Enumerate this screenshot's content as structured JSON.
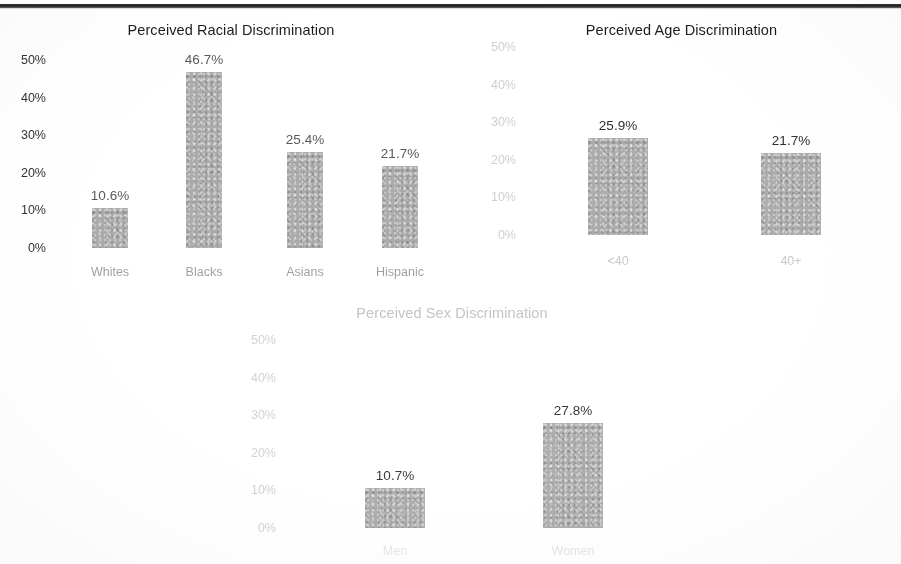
{
  "figure": {
    "page_rule": "horizontal-rule",
    "bar_color": "#a8a8a8",
    "background_color": "#ffffff"
  },
  "chart_data": [
    {
      "id": "racial",
      "type": "bar",
      "title": "Perceived Racial Discrimination",
      "xlabel": "",
      "ylabel": "",
      "categories": [
        "Whites",
        "Blacks",
        "Asians",
        "Hispanic"
      ],
      "values": [
        10.6,
        46.7,
        25.4,
        21.7
      ],
      "data_labels": [
        "10.6%",
        "46.7%",
        "25.4%",
        "21.7%"
      ],
      "ylim": [
        0,
        50
      ],
      "yticks": [
        50,
        40,
        30,
        20,
        10,
        0
      ],
      "ytick_labels": [
        "50%",
        "40%",
        "30%",
        "20%",
        "10%",
        "0%"
      ],
      "grid": false,
      "legend": "none"
    },
    {
      "id": "age",
      "type": "bar",
      "title": "Perceived Age Discrimination",
      "xlabel": "",
      "ylabel": "",
      "categories": [
        "<40",
        "40+"
      ],
      "values": [
        25.9,
        21.7
      ],
      "data_labels": [
        "25.9%",
        "21.7%"
      ],
      "ylim": [
        0,
        50
      ],
      "yticks": [
        50,
        40,
        30,
        20,
        10,
        0
      ],
      "ytick_labels": [
        "50%",
        "40%",
        "30%",
        "20%",
        "10%",
        "0%"
      ],
      "grid": false,
      "legend": "none"
    },
    {
      "id": "sex",
      "type": "bar",
      "title": "Perceived Sex Discrimination",
      "xlabel": "",
      "ylabel": "",
      "categories": [
        "Men",
        "Women"
      ],
      "values": [
        10.7,
        27.8
      ],
      "data_labels": [
        "10.7%",
        "27.8%"
      ],
      "ylim": [
        0,
        50
      ],
      "yticks": [
        50,
        40,
        30,
        20,
        10,
        0
      ],
      "ytick_labels": [
        "50%",
        "40%",
        "30%",
        "20%",
        "10%",
        "0%"
      ],
      "grid": false,
      "legend": "none"
    }
  ]
}
